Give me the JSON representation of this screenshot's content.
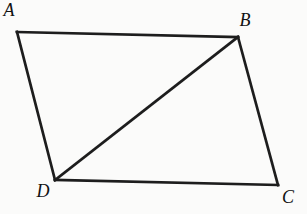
{
  "diagram": {
    "background": "#fbfbfa",
    "stroke_color": "#1d1d1d",
    "stroke_width": 2.7,
    "label_color": "#121212",
    "vertices": [
      {
        "id": "A",
        "label": "A",
        "x": 17,
        "y": 32,
        "label_x": 9,
        "label_y": 16
      },
      {
        "id": "B",
        "label": "B",
        "x": 238,
        "y": 37,
        "label_x": 245,
        "label_y": 26
      },
      {
        "id": "C",
        "label": "C",
        "x": 278,
        "y": 185,
        "label_x": 288,
        "label_y": 203
      },
      {
        "id": "D",
        "label": "D",
        "x": 55,
        "y": 180,
        "label_x": 43,
        "label_y": 197
      }
    ],
    "edges": [
      {
        "from": "A",
        "to": "B",
        "type": "side"
      },
      {
        "from": "B",
        "to": "C",
        "type": "side"
      },
      {
        "from": "C",
        "to": "D",
        "type": "side"
      },
      {
        "from": "D",
        "to": "A",
        "type": "side"
      },
      {
        "from": "D",
        "to": "B",
        "type": "diagonal"
      }
    ]
  }
}
